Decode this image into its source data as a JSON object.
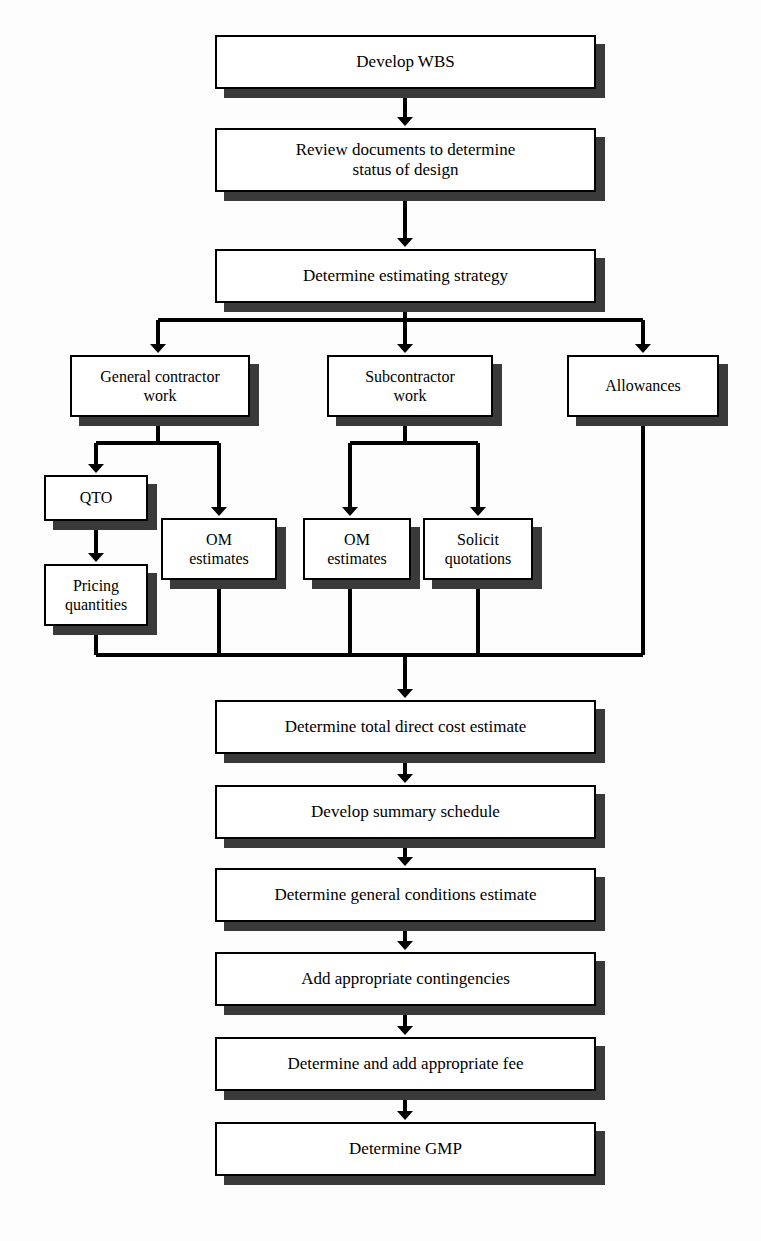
{
  "diagram": {
    "type": "flowchart",
    "orientation": "top-to-bottom",
    "background_color": "#fdfdfd",
    "box_fill_color": "#ffffff",
    "box_border_color": "#000000",
    "shadow_color": "#3a3a3a",
    "connector_color": "#000000",
    "font_size_main": 17,
    "font_size_small": 16
  },
  "nodes": [
    {
      "id": "develop-wbs",
      "label": "Develop WBS",
      "x": 215,
      "y": 35,
      "w": 381,
      "h": 54,
      "font": 17
    },
    {
      "id": "review-documents",
      "label": "Review documents to determine\nstatus of design",
      "x": 215,
      "y": 128,
      "w": 381,
      "h": 64,
      "font": 17
    },
    {
      "id": "determine-estimating-strategy",
      "label": "Determine estimating strategy",
      "x": 215,
      "y": 249,
      "w": 381,
      "h": 54,
      "font": 17
    },
    {
      "id": "general-contractor-work",
      "label": "General contractor\nwork",
      "x": 70,
      "y": 355,
      "w": 180,
      "h": 62,
      "font": 16
    },
    {
      "id": "subcontractor-work",
      "label": "Subcontractor\nwork",
      "x": 327,
      "y": 355,
      "w": 166,
      "h": 62,
      "font": 16
    },
    {
      "id": "allowances",
      "label": "Allowances",
      "x": 567,
      "y": 355,
      "w": 152,
      "h": 62,
      "font": 16
    },
    {
      "id": "qto",
      "label": "QTO",
      "x": 44,
      "y": 475,
      "w": 104,
      "h": 46,
      "font": 16
    },
    {
      "id": "pricing-quantities",
      "label": "Pricing\nquantities",
      "x": 44,
      "y": 564,
      "w": 104,
      "h": 62,
      "font": 16
    },
    {
      "id": "om-estimates-gc",
      "label": "OM\nestimates",
      "x": 161,
      "y": 518,
      "w": 116,
      "h": 62,
      "font": 16
    },
    {
      "id": "om-estimates-sub",
      "label": "OM\nestimates",
      "x": 303,
      "y": 518,
      "w": 108,
      "h": 62,
      "font": 16
    },
    {
      "id": "solicit-quotations",
      "label": "Solicit\nquotations",
      "x": 423,
      "y": 518,
      "w": 110,
      "h": 62,
      "font": 16
    },
    {
      "id": "determine-total-direct-cost",
      "label": "Determine total direct cost estimate",
      "x": 215,
      "y": 700,
      "w": 381,
      "h": 54,
      "font": 17
    },
    {
      "id": "develop-summary-schedule",
      "label": "Develop summary schedule",
      "x": 215,
      "y": 785,
      "w": 381,
      "h": 54,
      "font": 17
    },
    {
      "id": "determine-general-conditions",
      "label": "Determine general conditions estimate",
      "x": 215,
      "y": 868,
      "w": 381,
      "h": 54,
      "font": 17
    },
    {
      "id": "add-contingencies",
      "label": "Add appropriate contingencies",
      "x": 215,
      "y": 952,
      "w": 381,
      "h": 54,
      "font": 17
    },
    {
      "id": "determine-add-fee",
      "label": "Determine and add appropriate fee",
      "x": 215,
      "y": 1037,
      "w": 381,
      "h": 54,
      "font": 17
    },
    {
      "id": "determine-gmp",
      "label": "Determine GMP",
      "x": 215,
      "y": 1122,
      "w": 381,
      "h": 54,
      "font": 17
    }
  ],
  "connectors": {
    "description": "Orthogonal arrows; split buses fan out, merge bus collects five verticals into the total direct cost estimate.",
    "stroke_width": 4,
    "arrow_size": 9,
    "segments": [
      {
        "name": "wbs-to-review",
        "type": "arrow",
        "x1": 405,
        "y1": 89,
        "x2": 405,
        "y2": 126
      },
      {
        "name": "review-to-strategy",
        "type": "arrow",
        "x1": 405,
        "y1": 192,
        "x2": 405,
        "y2": 247
      },
      {
        "name": "strategy-to-bus",
        "type": "line",
        "x1": 405,
        "y1": 303,
        "x2": 405,
        "y2": 320
      },
      {
        "name": "split-bus-top",
        "type": "line",
        "x1": 158,
        "y1": 320,
        "x2": 643,
        "y2": 320
      },
      {
        "name": "bus-drop-gc",
        "type": "arrow",
        "x1": 158,
        "y1": 320,
        "x2": 158,
        "y2": 353
      },
      {
        "name": "bus-drop-sub",
        "type": "arrow",
        "x1": 405,
        "y1": 320,
        "x2": 405,
        "y2": 353
      },
      {
        "name": "bus-drop-allowances",
        "type": "arrow",
        "x1": 643,
        "y1": 320,
        "x2": 643,
        "y2": 353
      },
      {
        "name": "gc-to-split",
        "type": "line",
        "x1": 158,
        "y1": 417,
        "x2": 158,
        "y2": 443
      },
      {
        "name": "gc-split-bus",
        "type": "line",
        "x1": 96,
        "y1": 443,
        "x2": 219,
        "y2": 443
      },
      {
        "name": "gc-drop-qto",
        "type": "arrow",
        "x1": 96,
        "y1": 443,
        "x2": 96,
        "y2": 473
      },
      {
        "name": "gc-drop-om",
        "type": "arrow",
        "x1": 219,
        "y1": 443,
        "x2": 219,
        "y2": 516
      },
      {
        "name": "qto-to-pricing",
        "type": "arrow",
        "x1": 96,
        "y1": 521,
        "x2": 96,
        "y2": 562
      },
      {
        "name": "sub-to-split",
        "type": "line",
        "x1": 405,
        "y1": 417,
        "x2": 405,
        "y2": 443
      },
      {
        "name": "sub-split-bus",
        "type": "line",
        "x1": 350,
        "y1": 443,
        "x2": 478,
        "y2": 443
      },
      {
        "name": "sub-drop-om",
        "type": "arrow",
        "x1": 350,
        "y1": 443,
        "x2": 350,
        "y2": 516
      },
      {
        "name": "sub-drop-solicit",
        "type": "arrow",
        "x1": 478,
        "y1": 443,
        "x2": 478,
        "y2": 516
      },
      {
        "name": "pricing-to-merge",
        "type": "line",
        "x1": 96,
        "y1": 626,
        "x2": 96,
        "y2": 655
      },
      {
        "name": "om-gc-to-merge",
        "type": "line",
        "x1": 219,
        "y1": 580,
        "x2": 219,
        "y2": 655
      },
      {
        "name": "om-sub-to-merge",
        "type": "line",
        "x1": 350,
        "y1": 580,
        "x2": 350,
        "y2": 655
      },
      {
        "name": "solicit-to-merge",
        "type": "line",
        "x1": 478,
        "y1": 580,
        "x2": 478,
        "y2": 655
      },
      {
        "name": "allowances-to-merge",
        "type": "line",
        "x1": 643,
        "y1": 417,
        "x2": 643,
        "y2": 655
      },
      {
        "name": "merge-bus-bottom",
        "type": "line",
        "x1": 96,
        "y1": 655,
        "x2": 643,
        "y2": 655
      },
      {
        "name": "merge-to-total-cost",
        "type": "arrow",
        "x1": 405,
        "y1": 655,
        "x2": 405,
        "y2": 698
      },
      {
        "name": "total-to-schedule",
        "type": "arrow",
        "x1": 405,
        "y1": 754,
        "x2": 405,
        "y2": 783
      },
      {
        "name": "schedule-to-general",
        "type": "arrow",
        "x1": 405,
        "y1": 839,
        "x2": 405,
        "y2": 866
      },
      {
        "name": "general-to-contingencies",
        "type": "arrow",
        "x1": 405,
        "y1": 922,
        "x2": 405,
        "y2": 950
      },
      {
        "name": "contingencies-to-fee",
        "type": "arrow",
        "x1": 405,
        "y1": 1006,
        "x2": 405,
        "y2": 1035
      },
      {
        "name": "fee-to-gmp",
        "type": "arrow",
        "x1": 405,
        "y1": 1091,
        "x2": 405,
        "y2": 1120
      }
    ]
  }
}
